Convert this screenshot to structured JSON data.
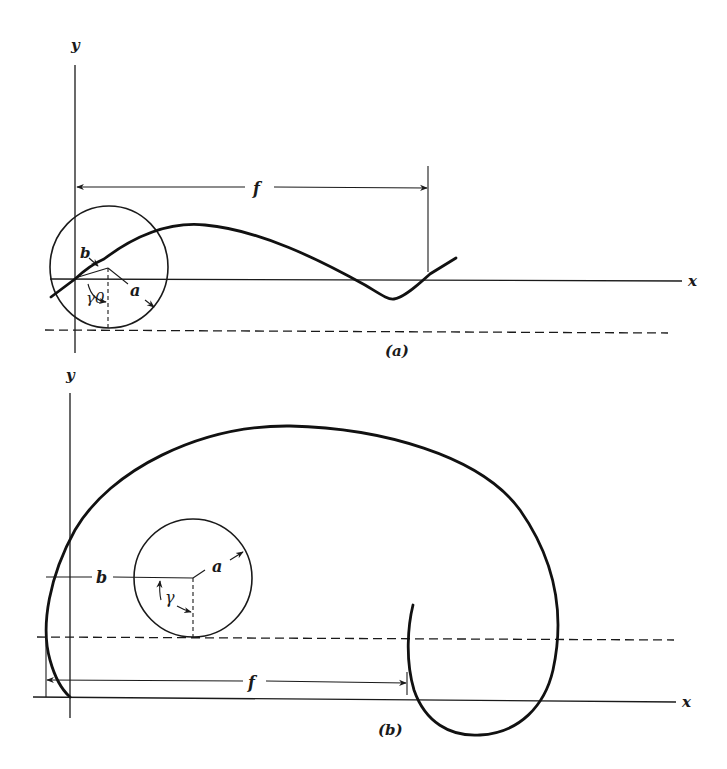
{
  "figure": {
    "panel_a": {
      "caption": "(a)",
      "x_axis_label": "x",
      "y_axis_label": "y",
      "dimension_label": "f",
      "radius_label": "a",
      "offset_label": "b",
      "angle_label": "γ0"
    },
    "panel_b": {
      "caption": "(b)",
      "x_axis_label": "x",
      "y_axis_label": "y",
      "dimension_label": "f",
      "radius_label": "a",
      "offset_label": "b",
      "angle_label": "γ"
    }
  },
  "colors": {
    "ink": "#111111",
    "background": "#ffffff"
  }
}
